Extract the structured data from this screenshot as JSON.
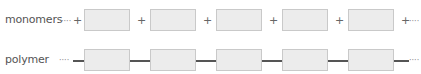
{
  "rows": {
    "monomers": {
      "label": "monomers",
      "unit_count": 5,
      "separator": "+",
      "ellipsis": "····"
    },
    "polymer": {
      "label": "polymer",
      "unit_count": 5,
      "separator": "bond-line",
      "ellipsis": "····"
    }
  },
  "colors": {
    "box_fill": "#ececec",
    "box_border": "#c9c9c9",
    "bond": "#555555",
    "text": "#555555"
  }
}
